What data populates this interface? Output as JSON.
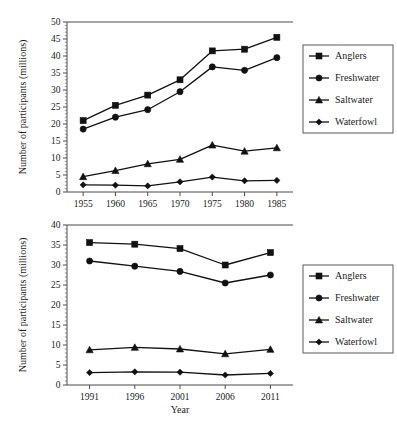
{
  "figure": {
    "background_color": "#ffffff",
    "line_color": "#111111",
    "axis_color": "#4a4a4a"
  },
  "chart_data": [
    {
      "type": "line",
      "panel": "top",
      "title": "",
      "xlabel": "",
      "ylabel": "Number of participants (millions)",
      "x": [
        1955,
        1960,
        1965,
        1970,
        1975,
        1980,
        1985
      ],
      "xtick_labels": [
        "1955",
        "1960",
        "1965",
        "1970",
        "1975",
        "1980",
        "1985"
      ],
      "xlim": [
        1952.5,
        1987.5
      ],
      "ylim": [
        0,
        50
      ],
      "ytick_labels": [
        "0",
        "5",
        "10",
        "15",
        "20",
        "25",
        "30",
        "35",
        "40",
        "45",
        "50"
      ],
      "ytick_values": [
        0,
        5,
        10,
        15,
        20,
        25,
        30,
        35,
        40,
        45,
        50
      ],
      "yminor_step": 1,
      "grid": false,
      "legend_position": "right-outside",
      "series": [
        {
          "name": "Anglers",
          "marker": "square",
          "values": [
            21.0,
            25.5,
            28.5,
            33.0,
            41.5,
            42.0,
            45.5
          ]
        },
        {
          "name": "Freshwater",
          "marker": "circle",
          "values": [
            18.5,
            22.0,
            24.2,
            29.5,
            36.8,
            35.8,
            39.5
          ]
        },
        {
          "name": "Saltwater",
          "marker": "triangle",
          "values": [
            4.5,
            6.3,
            8.3,
            9.6,
            13.8,
            12.0,
            13.0
          ]
        },
        {
          "name": "Waterfowl",
          "marker": "diamond",
          "values": [
            2.1,
            2.0,
            1.8,
            3.0,
            4.4,
            3.3,
            3.4
          ]
        }
      ]
    },
    {
      "type": "line",
      "panel": "bottom",
      "title": "",
      "xlabel": "Year",
      "ylabel": "Number of participants (millions)",
      "x": [
        1991,
        1996,
        2001,
        2006,
        2011
      ],
      "xtick_labels": [
        "1991",
        "1996",
        "2001",
        "2006",
        "2011"
      ],
      "xlim": [
        1988.5,
        2013.5
      ],
      "ylim": [
        0,
        40
      ],
      "ytick_labels": [
        "0",
        "5",
        "10",
        "15",
        "20",
        "25",
        "30",
        "35",
        "40"
      ],
      "ytick_values": [
        0,
        5,
        10,
        15,
        20,
        25,
        30,
        35,
        40
      ],
      "yminor_step": 1,
      "grid": false,
      "legend_position": "right-outside",
      "series": [
        {
          "name": "Anglers",
          "marker": "square",
          "values": [
            35.6,
            35.2,
            34.1,
            30.0,
            33.1
          ]
        },
        {
          "name": "Freshwater",
          "marker": "circle",
          "values": [
            31.0,
            29.7,
            28.4,
            25.5,
            27.5
          ]
        },
        {
          "name": "Saltwater",
          "marker": "triangle",
          "values": [
            8.8,
            9.4,
            9.0,
            7.8,
            8.9
          ]
        },
        {
          "name": "Waterfowl",
          "marker": "diamond",
          "values": [
            3.1,
            3.3,
            3.2,
            2.5,
            2.9
          ]
        }
      ]
    }
  ]
}
